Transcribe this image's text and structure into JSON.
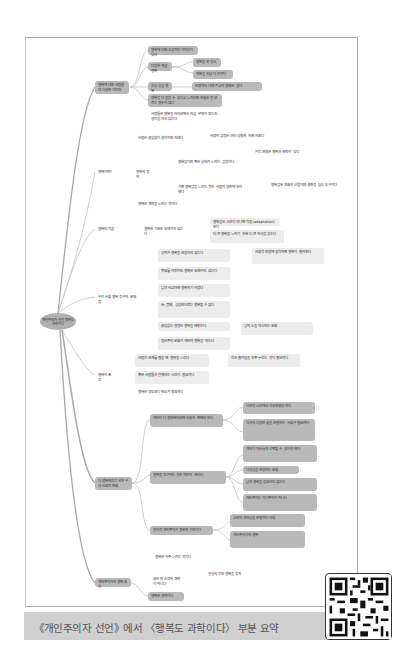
{
  "caption": "《개인주의자 선언》에서 〈행복도 과학이다〉 부분 요약",
  "root": {
    "label": "개인주의자 선언 행복도 과학이다"
  },
  "branches": [
    {
      "label": "행복에 대한 사람들의 다양한 이미지",
      "children": [
        "행복에 대해 추상적인 이미지가 있다",
        "다양한 개념 행복",
        "행복을 꼭 일시",
        "행복을 지금 더 가꾸다",
        "추상 공감 행복",
        "인류역사 이래 최고의 행복은 없다",
        "행복을 더 얻을 수 있다고 느끼지만 현실은 잘 모르는 경우가 많다",
        "사람들은 행복을 바라보면서 지금 무엇이 맞는지 생각을 하지 않는다"
      ]
    },
    {
      "label": "행복이란?",
      "children": [
        "행복의 정의",
        "사람은 끊임없이 생각하며 지낸다",
        "사람의 감정은 여러 상황에 의해 바뀐다",
        "행복감이란 좋은 상태가 느끼는 감정이다",
        "외적 환경은 행복과 관련이 있다",
        "기쁜 행복감을 느끼는 것은 사람의 생존에 유리했다",
        "행복감은 진화의 산물이며 생존을 돕는 도구이다",
        "행복은 쾌락을 느끼는 것이다"
      ]
    },
    {
      "label": "행복의 적응",
      "children": [
        "행복한 기분은 오래가지 않는다",
        "행복감은 시간이 지나면 적응(adaptation)된다",
        "더 큰 행복을 느끼기 위해 더 큰 자극을 찾는다"
      ]
    },
    {
      "label": "우리 사회 행복 추구의 문제점",
      "children": [
        "성취가 행복을 보장하지 않는다",
        "목표를 이루어도 행복은 오래가지 않는다",
        "남과 비교하면 행복하기 어렵다",
        "돈, 명예, 성공만으로는 행복할 수 없다",
        "끊임없는 경쟁은 행복을 빼앗는다",
        "집단주의 문화가 개인의 행복을 막는다",
        "사회적 인정에 집착하면 행복이 멀어진다",
        "남의 눈을 의식하는 문화"
      ]
    },
    {
      "label": "행복의 조건",
      "children": [
        "사람과 관계를 맺을 때 행복을 느낀다",
        "좋은 사람들과 함께하는 시간이 중요하다",
        "행복은 강도보다 빈도가 중요하다",
        "작은 즐거움을 자주 누리는 것이 중요하다"
      ]
    },
    {
      "label": "더 행복해지기 위한 우리 사회의 변화",
      "children": [
        "개인이 더 행복해지려면 사회가 변해야 한다",
        "타인의 시선에서 자유로워야 한다",
        "각자의 다양한 삶을 존중하는 사회가 필요하다",
        "행복을 추구하는 것은 개인의 권리다",
        "개인이 자유롭게 선택할 수 있어야 한다",
        "다양성을 인정하는 문화",
        "남의 행복을 강요하지 않는다",
        "개인주의는 이기주의가 아니다",
        "합리적 개인주의가 행복의 기반이다",
        "서로의 개인성을 존중하는 사회",
        "개인주의자의 행복"
      ]
    },
    {
      "label": "개인주의자의 행복 요약",
      "children": [
        "행복은 자주 느끼는 것이다",
        "삶은 한 순간의 쾌락이 아니다",
        "일상의 작은 행복을 찾자",
        "행복은 과학이다"
      ]
    }
  ]
}
